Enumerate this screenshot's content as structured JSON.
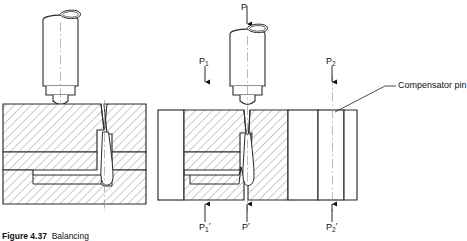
{
  "figure": {
    "caption_prefix": "Figure 4.37",
    "caption_text": "Balancing",
    "caption_full": "Figure 4.37  Balancing",
    "domain_note": "resistance/projection welding die with compensator pin"
  },
  "colors": {
    "ink": "#1a1a1a",
    "line": "#333333",
    "hatch": "#9a9a9a",
    "centerline": "#999999",
    "background": "#ffffff"
  },
  "left_view": {
    "name": "unbalanced-setup",
    "punch": {
      "name": "electrode-punch"
    },
    "die_upper": {
      "name": "upper-die-block",
      "hatched": true
    },
    "die_middle": {
      "name": "middle-plate",
      "hatched": true
    },
    "die_lower": {
      "name": "lower-die-block",
      "hatched": true
    },
    "weld": {
      "name": "weld-nugget"
    }
  },
  "right_view": {
    "name": "compensated-setup",
    "punch": {
      "name": "electrode-punch"
    },
    "die_block": {
      "name": "die-block",
      "hatched": true
    },
    "compensator": {
      "name": "compensator-pin-block",
      "hatched": false
    }
  },
  "labels": {
    "force_top": "P",
    "force_left": "P",
    "force_left_sub": "1",
    "force_right": "P",
    "force_right_sub": "2",
    "react_left": "P",
    "react_left_sub": "1",
    "react_left_prime": "′",
    "react_center": "P",
    "react_center_prime": "′",
    "react_right": "P",
    "react_right_sub": "2",
    "react_right_prime": "′",
    "compensator_pin": "Compensator pin"
  }
}
